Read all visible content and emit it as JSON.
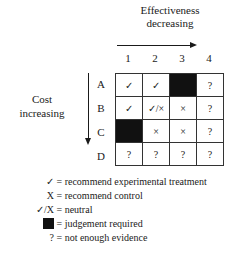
{
  "diagram": {
    "top_axis": {
      "line1": "Effectiveness",
      "line2": "decreasing",
      "direction": "right"
    },
    "side_axis": {
      "line1": "Cost",
      "line2": "increasing",
      "direction": "down"
    },
    "columns": [
      "1",
      "2",
      "3",
      "4"
    ],
    "rows": [
      {
        "label": "A",
        "cells": [
          "✓",
          "✓",
          "",
          "?"
        ],
        "black": [
          false,
          false,
          true,
          false
        ]
      },
      {
        "label": "B",
        "cells": [
          "✓",
          "✓/×",
          "×",
          "?"
        ],
        "black": [
          false,
          false,
          false,
          false
        ]
      },
      {
        "label": "C",
        "cells": [
          "",
          "×",
          "×",
          "?"
        ],
        "black": [
          true,
          false,
          false,
          false
        ]
      },
      {
        "label": "D",
        "cells": [
          "?",
          "?",
          "?",
          "?"
        ],
        "black": [
          false,
          false,
          false,
          false
        ]
      }
    ]
  },
  "legend": [
    {
      "symbol": "✓",
      "text": "= recommend experimental treatment"
    },
    {
      "symbol": "X",
      "text": "= recommend control"
    },
    {
      "symbol": "✓/X",
      "text": "= neutral"
    },
    {
      "symbol": "black-square",
      "text": "= judgement required"
    },
    {
      "symbol": "?",
      "text": "= not enough evidence"
    }
  ],
  "colors": {
    "ink": "#1a1a1a",
    "black_cell": "#111111",
    "background": "#ffffff"
  }
}
